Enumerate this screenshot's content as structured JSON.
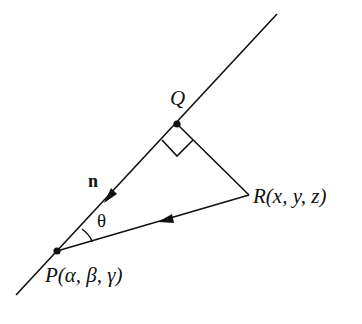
{
  "diagram": {
    "type": "geometry",
    "colors": {
      "stroke": "#111111",
      "background": "#ffffff"
    },
    "points": {
      "Q": {
        "label": "Q",
        "x": 177,
        "y": 124
      },
      "P": {
        "label": "P(α, β, γ)",
        "x": 57,
        "y": 251
      },
      "R": {
        "label": "R(x, y, z)",
        "x": 249,
        "y": 195
      }
    },
    "labels": {
      "q": "Q",
      "p": "P(α, β, γ)",
      "r": "R(x, y, z)",
      "n": "n",
      "theta": "θ"
    },
    "line": {
      "from": [
        16,
        295
      ],
      "to": [
        277,
        14
      ]
    },
    "segments": [
      {
        "name": "QR",
        "from": "Q",
        "to": "R"
      },
      {
        "name": "RP",
        "from": "R",
        "to": "P",
        "arrow": true
      }
    ],
    "vector": {
      "name": "n",
      "direction": "Q to P",
      "arrow": true
    },
    "right_angle_at": "Q",
    "angle": {
      "name": "theta",
      "at": "P",
      "between": [
        "n",
        "RP"
      ]
    }
  }
}
